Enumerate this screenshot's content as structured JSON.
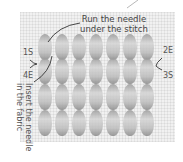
{
  "diagram": {
    "type": "stitch-instruction-illustration",
    "callouts": {
      "top": "Run the needle under the stitch",
      "top_line1": "Run the needle",
      "top_line2": "under the stitch",
      "side": "Insert the needle in the fabric",
      "side_line1": "Insert the needle",
      "side_line2": "in the fabric"
    },
    "point_labels": {
      "left_top": "1S",
      "left_bottom": "4E",
      "right_top": "2E",
      "right_bottom": "3S"
    },
    "colors": {
      "background": "#ffffff",
      "fabric": "#f1f1f1",
      "stitch_dark": "#8a8a8a",
      "stitch_light": "#d4d4d4",
      "text": "#555555",
      "leader_line": "#333333"
    },
    "stitch_grid": {
      "rows": 4,
      "columns": 7
    }
  }
}
